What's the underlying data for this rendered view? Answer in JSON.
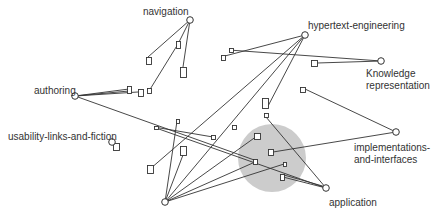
{
  "diagram": {
    "colors": {
      "line": "#333333",
      "node_fill": "#ffffff",
      "cluster_fill": "#cccccc",
      "text": "#333333"
    },
    "cluster": {
      "cx": 272,
      "cy": 158,
      "r": 34
    },
    "nodes": [
      {
        "id": "navigation",
        "label": "navigation",
        "x": 190,
        "y": 20,
        "label_x": 143,
        "label_y": 6
      },
      {
        "id": "hypertext-engineering",
        "label": "hypertext-engineering",
        "x": 305,
        "y": 35,
        "label_x": 308,
        "label_y": 20
      },
      {
        "id": "knowledge-representation",
        "label": "Knowledge\nrepresentation",
        "x": 381,
        "y": 61,
        "label_x": 366,
        "label_y": 68
      },
      {
        "id": "authoring",
        "label": "authoring",
        "x": 75,
        "y": 96,
        "label_x": 34,
        "label_y": 85
      },
      {
        "id": "usability-links-and-fiction",
        "label": "usability-links-and-fiction",
        "x": 112,
        "y": 142,
        "label_x": 8,
        "label_y": 131
      },
      {
        "id": "implementations-and-interfaces",
        "label": "implementations-\nand-interfaces",
        "x": 396,
        "y": 132,
        "label_x": 354,
        "label_y": 142
      },
      {
        "id": "application",
        "label": "application",
        "x": 326,
        "y": 188,
        "label_x": 329,
        "label_y": 197
      },
      {
        "id": "bottom-hub",
        "label": "",
        "x": 165,
        "y": 202,
        "label_x": 0,
        "label_y": 0
      }
    ],
    "docs": [
      {
        "x": 146,
        "y": 57,
        "w": 5,
        "h": 7
      },
      {
        "x": 176,
        "y": 41,
        "w": 4,
        "h": 7
      },
      {
        "x": 180,
        "y": 67,
        "w": 6,
        "h": 10
      },
      {
        "x": 127,
        "y": 86,
        "w": 4,
        "h": 7
      },
      {
        "x": 138,
        "y": 89,
        "w": 5,
        "h": 7
      },
      {
        "x": 147,
        "y": 88,
        "w": 4,
        "h": 5
      },
      {
        "x": 154,
        "y": 126,
        "w": 4,
        "h": 3
      },
      {
        "x": 113,
        "y": 143,
        "w": 6,
        "h": 7
      },
      {
        "x": 229,
        "y": 48,
        "w": 4,
        "h": 4
      },
      {
        "x": 221,
        "y": 55,
        "w": 4,
        "h": 5
      },
      {
        "x": 311,
        "y": 60,
        "w": 6,
        "h": 6
      },
      {
        "x": 300,
        "y": 87,
        "w": 5,
        "h": 5
      },
      {
        "x": 262,
        "y": 98,
        "w": 6,
        "h": 10
      },
      {
        "x": 264,
        "y": 113,
        "w": 4,
        "h": 4
      },
      {
        "x": 176,
        "y": 119,
        "w": 3,
        "h": 4
      },
      {
        "x": 211,
        "y": 135,
        "w": 4,
        "h": 4
      },
      {
        "x": 180,
        "y": 146,
        "w": 6,
        "h": 9
      },
      {
        "x": 147,
        "y": 165,
        "w": 6,
        "h": 8
      },
      {
        "x": 254,
        "y": 133,
        "w": 6,
        "h": 6
      },
      {
        "x": 268,
        "y": 149,
        "w": 5,
        "h": 6
      },
      {
        "x": 253,
        "y": 159,
        "w": 4,
        "h": 5
      },
      {
        "x": 283,
        "y": 162,
        "w": 3,
        "h": 4
      },
      {
        "x": 280,
        "y": 174,
        "w": 4,
        "h": 6
      },
      {
        "x": 232,
        "y": 125,
        "w": 4,
        "h": 4
      }
    ],
    "edges": [
      {
        "x1": 190,
        "y1": 20,
        "x2": 148,
        "y2": 57
      },
      {
        "x1": 190,
        "y1": 20,
        "x2": 178,
        "y2": 44
      },
      {
        "x1": 178,
        "y1": 44,
        "x2": 149,
        "y2": 91
      },
      {
        "x1": 190,
        "y1": 20,
        "x2": 183,
        "y2": 67
      },
      {
        "x1": 75,
        "y1": 96,
        "x2": 129,
        "y2": 89
      },
      {
        "x1": 75,
        "y1": 96,
        "x2": 138,
        "y2": 92
      },
      {
        "x1": 75,
        "y1": 96,
        "x2": 129,
        "y2": 91
      },
      {
        "x1": 75,
        "y1": 96,
        "x2": 257,
        "y2": 161
      },
      {
        "x1": 305,
        "y1": 35,
        "x2": 221,
        "y2": 57
      },
      {
        "x1": 229,
        "y1": 50,
        "x2": 381,
        "y2": 61
      },
      {
        "x1": 317,
        "y1": 63,
        "x2": 381,
        "y2": 61
      },
      {
        "x1": 305,
        "y1": 35,
        "x2": 150,
        "y2": 169
      },
      {
        "x1": 305,
        "y1": 35,
        "x2": 267,
        "y2": 108
      },
      {
        "x1": 305,
        "y1": 35,
        "x2": 165,
        "y2": 202
      },
      {
        "x1": 305,
        "y1": 89,
        "x2": 396,
        "y2": 132
      },
      {
        "x1": 266,
        "y1": 117,
        "x2": 326,
        "y2": 188
      },
      {
        "x1": 273,
        "y1": 152,
        "x2": 396,
        "y2": 132
      },
      {
        "x1": 156,
        "y1": 128,
        "x2": 326,
        "y2": 188
      },
      {
        "x1": 177,
        "y1": 121,
        "x2": 165,
        "y2": 202
      },
      {
        "x1": 183,
        "y1": 155,
        "x2": 165,
        "y2": 202
      },
      {
        "x1": 165,
        "y1": 202,
        "x2": 257,
        "y2": 136
      },
      {
        "x1": 165,
        "y1": 202,
        "x2": 284,
        "y2": 164
      },
      {
        "x1": 165,
        "y1": 202,
        "x2": 255,
        "y2": 162
      },
      {
        "x1": 283,
        "y1": 177,
        "x2": 326,
        "y2": 188
      },
      {
        "x1": 284,
        "y1": 175,
        "x2": 326,
        "y2": 187
      },
      {
        "x1": 213,
        "y1": 137,
        "x2": 154,
        "y2": 127
      }
    ]
  }
}
